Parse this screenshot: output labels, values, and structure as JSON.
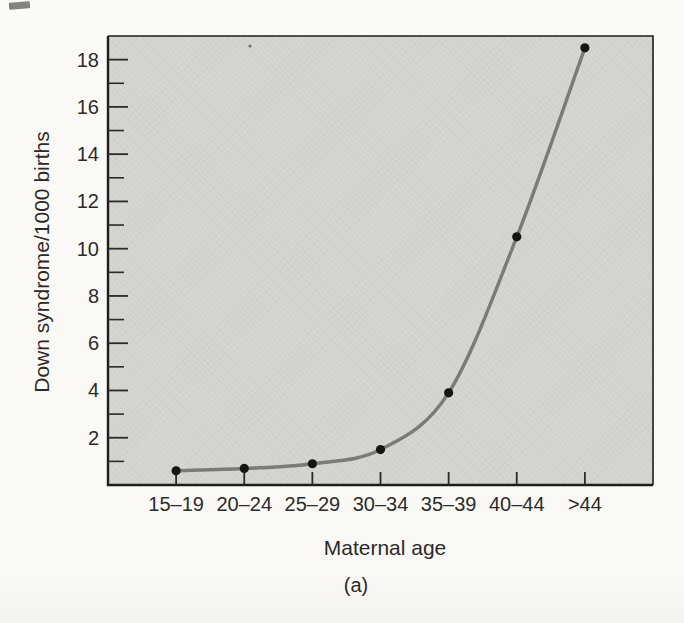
{
  "chart_data": {
    "type": "line",
    "title": "",
    "categories": [
      "15–19",
      "20–24",
      "25–29",
      "30–34",
      "35–39",
      "40–44",
      ">44"
    ],
    "values": [
      0.6,
      0.7,
      0.9,
      1.5,
      3.9,
      10.5,
      18.5
    ],
    "series": [
      {
        "name": "Down syndrome incidence",
        "values": [
          0.6,
          0.7,
          0.9,
          1.5,
          3.9,
          10.5,
          18.5
        ]
      }
    ],
    "xlabel": "Maternal age",
    "ylabel": "Down syndrome/1000 births",
    "caption": "(a)",
    "ylim": [
      0,
      19
    ],
    "yticks_major": [
      2,
      4,
      6,
      8,
      10,
      12,
      14,
      16,
      18
    ],
    "yticks_minor": [
      1,
      3,
      5,
      7,
      9,
      11,
      13,
      15,
      17
    ],
    "grid": false,
    "legend": "none",
    "marker": "filled-circle",
    "colors": {
      "curve": "#7b7b78",
      "marker": "#141414",
      "axis": "#1d1d1c",
      "tick": "#2a2a28",
      "plot_background": "#d6d5d1",
      "page_background": "#fbfaf7",
      "text": "#2b2b2b"
    }
  }
}
